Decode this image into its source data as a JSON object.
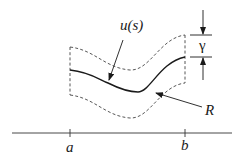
{
  "diagram": {
    "labels": {
      "curve": "u(s)",
      "region": "R",
      "width": "γ",
      "left_endpoint": "a",
      "right_endpoint": "b"
    },
    "colors": {
      "stroke": "#1a1a1a",
      "dashed": "#444444",
      "background": "#ffffff"
    }
  }
}
